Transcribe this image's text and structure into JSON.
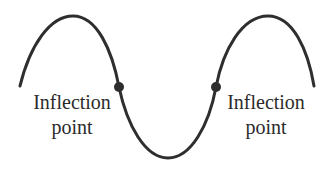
{
  "diagram": {
    "type": "sine-like curve with inflection points",
    "curve_color": "#2e2e2e",
    "labels": {
      "left": {
        "line1": "Inflection",
        "line2": "point"
      },
      "right": {
        "line1": "Inflection",
        "line2": "point"
      }
    },
    "points": [
      {
        "name": "left-inflection",
        "x": 119,
        "y": 87
      },
      {
        "name": "right-inflection",
        "x": 216,
        "y": 87
      }
    ]
  }
}
